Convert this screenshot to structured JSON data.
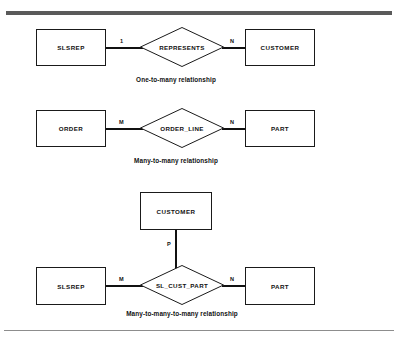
{
  "figure": {
    "rules": {
      "top_color": "#5a5a5a",
      "bottom_color": "#8d8d8d"
    },
    "diagrams": [
      {
        "id": "one-to-many",
        "caption": "One-to-many relationship",
        "left_entity": "SLSREP",
        "right_entity": "CUSTOMER",
        "relationship": "REPRESENTS",
        "left_cardinality": "1",
        "right_cardinality": "N"
      },
      {
        "id": "many-to-many",
        "caption": "Many-to-many relationship",
        "left_entity": "ORDER",
        "right_entity": "PART",
        "relationship": "ORDER_LINE",
        "left_cardinality": "M",
        "right_cardinality": "N"
      },
      {
        "id": "many-to-many-to-many",
        "caption": "Many-to-many-to-many relationship",
        "top_entity": "CUSTOMER",
        "left_entity": "SLSREP",
        "right_entity": "PART",
        "relationship": "SL_CUST_PART",
        "top_cardinality": "P",
        "left_cardinality": "M",
        "right_cardinality": "N"
      }
    ]
  }
}
